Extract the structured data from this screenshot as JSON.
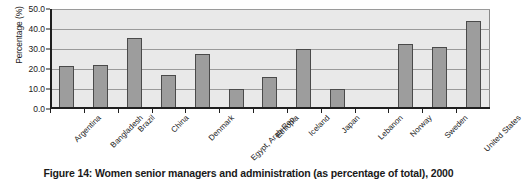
{
  "caption": "Figure 14: Women senior managers and administration (as percentage of total), 2000",
  "chart_data": {
    "type": "bar",
    "title": "Figure 14: Women senior managers and administration (as percentage of total), 2000",
    "xlabel": "",
    "ylabel": "Percentage (%)",
    "ylim": [
      0,
      50
    ],
    "yticks": [
      0,
      10,
      20,
      30,
      40,
      50
    ],
    "ytick_labels": [
      "0.0",
      "10.0",
      "20.0",
      "30.0",
      "40.0",
      "50.0"
    ],
    "grid": true,
    "legend": false,
    "bar_color": "#9d9d9d",
    "bar_edge_color": "#4a4a4a",
    "plot_background": "#e9e9e9",
    "categories": [
      "Argentina",
      "Bangladesh",
      "Brazil",
      "China",
      "Denmark",
      "Egypt, Arab Rep.",
      "Ethiopia",
      "Iceland",
      "Japan",
      "Lebanon",
      "Norway",
      "Sweden",
      "United States"
    ],
    "values": [
      21.5,
      21.8,
      35.3,
      17.0,
      27.6,
      10.2,
      16.0,
      29.8,
      9.8,
      0.0,
      32.4,
      31.0,
      44.2
    ]
  }
}
